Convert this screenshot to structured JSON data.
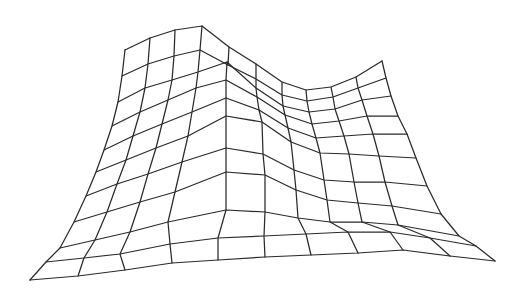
{
  "figure": {
    "type": "wireframe-surface",
    "width": 526,
    "height": 294,
    "background": "#ffffff",
    "line_color": "#2a2a2a",
    "grid_rows": 11,
    "grid_cols": 11
  },
  "mesh": {
    "rows": [
      [
        [
          125,
          50
        ],
        [
          150,
          38
        ],
        [
          175,
          30
        ],
        [
          202,
          26
        ],
        [
          229,
          47
        ],
        [
          256,
          64
        ],
        [
          282,
          82
        ],
        [
          306,
          90
        ],
        [
          331,
          87
        ],
        [
          356,
          77
        ],
        [
          382,
          61
        ]
      ],
      [
        [
          122,
          76
        ],
        [
          148,
          64
        ],
        [
          174,
          56
        ],
        [
          200,
          50
        ],
        [
          228,
          65
        ],
        [
          256,
          79
        ],
        [
          282,
          95
        ],
        [
          307,
          101
        ],
        [
          333,
          97
        ],
        [
          358,
          88
        ],
        [
          386,
          78
        ]
      ],
      [
        [
          118,
          102
        ],
        [
          145,
          88
        ],
        [
          172,
          80
        ],
        [
          198,
          72
        ],
        [
          227,
          62
        ],
        [
          256,
          88
        ],
        [
          283,
          106
        ],
        [
          309,
          112
        ],
        [
          335,
          109
        ],
        [
          362,
          100
        ],
        [
          391,
          96
        ]
      ],
      [
        [
          112,
          126
        ],
        [
          140,
          112
        ],
        [
          168,
          100
        ],
        [
          196,
          88
        ],
        [
          226,
          80
        ],
        [
          257,
          97
        ],
        [
          285,
          115
        ],
        [
          312,
          124
        ],
        [
          339,
          121
        ],
        [
          367,
          116
        ],
        [
          398,
          116
        ]
      ],
      [
        [
          104,
          150
        ],
        [
          133,
          136
        ],
        [
          162,
          124
        ],
        [
          192,
          112
        ],
        [
          226,
          98
        ],
        [
          259,
          110
        ],
        [
          288,
          128
        ],
        [
          316,
          138
        ],
        [
          344,
          136
        ],
        [
          373,
          134
        ],
        [
          407,
          134
        ]
      ],
      [
        [
          96,
          172
        ],
        [
          126,
          160
        ],
        [
          156,
          148
        ],
        [
          188,
          136
        ],
        [
          226,
          116
        ],
        [
          262,
          122
        ],
        [
          291,
          142
        ],
        [
          320,
          153
        ],
        [
          349,
          154
        ],
        [
          379,
          156
        ],
        [
          416,
          158
        ]
      ],
      [
        [
          86,
          196
        ],
        [
          117,
          184
        ],
        [
          148,
          174
        ],
        [
          182,
          162
        ],
        [
          226,
          148
        ],
        [
          263,
          154
        ],
        [
          294,
          170
        ],
        [
          324,
          180
        ],
        [
          354,
          182
        ],
        [
          385,
          182
        ],
        [
          427,
          186
        ]
      ],
      [
        [
          74,
          222
        ],
        [
          107,
          212
        ],
        [
          140,
          202
        ],
        [
          175,
          192
        ],
        [
          226,
          172
        ],
        [
          265,
          175
        ],
        [
          296,
          190
        ],
        [
          327,
          200
        ],
        [
          358,
          203
        ],
        [
          392,
          206
        ],
        [
          441,
          214
        ]
      ],
      [
        [
          60,
          248
        ],
        [
          95,
          240
        ],
        [
          130,
          232
        ],
        [
          168,
          222
        ],
        [
          226,
          210
        ],
        [
          265,
          212
        ],
        [
          298,
          218
        ],
        [
          330,
          222
        ],
        [
          362,
          222
        ],
        [
          398,
          225
        ],
        [
          459,
          236
        ]
      ],
      [
        [
          46,
          262
        ],
        [
          84,
          258
        ],
        [
          120,
          254
        ],
        [
          170,
          244
        ],
        [
          218,
          238
        ],
        [
          264,
          236
        ],
        [
          306,
          234
        ],
        [
          348,
          232
        ],
        [
          390,
          232
        ],
        [
          430,
          238
        ],
        [
          476,
          246
        ]
      ],
      [
        [
          30,
          280
        ],
        [
          78,
          276
        ],
        [
          125,
          270
        ],
        [
          172,
          263
        ],
        [
          218,
          260
        ],
        [
          265,
          257
        ],
        [
          311,
          255
        ],
        [
          358,
          253
        ],
        [
          403,
          250
        ],
        [
          450,
          256
        ],
        [
          495,
          261
        ]
      ]
    ]
  }
}
